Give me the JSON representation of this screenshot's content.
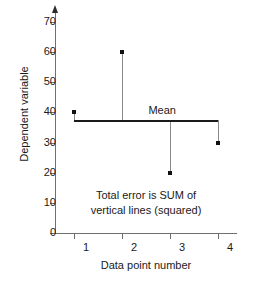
{
  "chart_data": {
    "type": "scatter",
    "title": "",
    "xlabel": "Data point number",
    "ylabel": "Dependent variable",
    "categories": [
      "1",
      "2",
      "3",
      "4"
    ],
    "x": [
      1,
      2,
      3,
      4
    ],
    "values": [
      40,
      60,
      20,
      30
    ],
    "series": [
      {
        "name": "Dependent variable",
        "values": [
          40,
          60,
          20,
          30
        ]
      }
    ],
    "mean": 37.5,
    "mean_label": "Mean",
    "residuals": [
      2.5,
      22.5,
      -17.5,
      -7.5
    ],
    "xlim": [
      0.5,
      4.5
    ],
    "ylim": [
      0,
      70
    ],
    "y_ticks": [
      0,
      10,
      20,
      30,
      40,
      50,
      60,
      70
    ],
    "y_tick_labels": [
      "0",
      "10",
      "20",
      "30",
      "40",
      "50",
      "60",
      "70"
    ],
    "x_ticks": [
      1,
      2,
      3,
      4
    ],
    "x_tick_labels": [
      "1",
      "2",
      "3",
      "4"
    ],
    "grid": false,
    "legend": "none",
    "annotations": [
      "Total error is SUM of",
      "vertical lines (squared)"
    ],
    "colors": {
      "point": "#111111",
      "mean_line": "#1a1a1a",
      "residual_line": "#8a8a8a",
      "axis": "#6f6f6f",
      "text": "#1a1a1a",
      "background": "#ffffff"
    }
  }
}
